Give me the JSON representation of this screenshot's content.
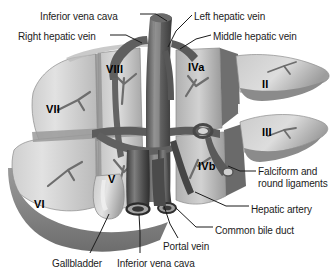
{
  "figure": {
    "width": 335,
    "height": 273,
    "background_color": "#ffffff",
    "style": "grayscale medical illustration"
  },
  "colors": {
    "background": "#ffffff",
    "text": "#1b1b1b",
    "leader_line": "#1b1b1b",
    "parenchyma_light": "#d9d9d9",
    "parenchyma_mid": "#b4b4b4",
    "parenchyma_dark": "#8f8f8f",
    "shadow": "#6e6e6e",
    "vessel_dark": "#4a4a4a",
    "vessel_darkest": "#2a2a2a",
    "vessel_mid": "#707070",
    "highlight": "#efefef"
  },
  "labels": [
    {
      "id": "inferior-vena-cava-top",
      "text": "Inferior vena cava",
      "x": 40,
      "y": 11,
      "align": "left"
    },
    {
      "id": "left-hepatic-vein",
      "text": "Left hepatic vein",
      "x": 194,
      "y": 11,
      "align": "left"
    },
    {
      "id": "right-hepatic-vein",
      "text": "Right hepatic vein",
      "x": 18,
      "y": 31,
      "align": "left"
    },
    {
      "id": "middle-hepatic-vein",
      "text": "Middle hepatic vein",
      "x": 213,
      "y": 31,
      "align": "left"
    },
    {
      "id": "falciform-round-ligaments",
      "text": "Falciform and\nround ligaments",
      "x": 258,
      "y": 166,
      "align": "left"
    },
    {
      "id": "hepatic-artery",
      "text": "Hepatic artery",
      "x": 251,
      "y": 204,
      "align": "left"
    },
    {
      "id": "common-bile-duct",
      "text": "Common bile duct",
      "x": 215,
      "y": 225,
      "align": "left"
    },
    {
      "id": "portal-vein",
      "text": "Portal vein",
      "x": 163,
      "y": 241,
      "align": "left"
    },
    {
      "id": "gallbladder",
      "text": "Gallbladder",
      "x": 52,
      "y": 258,
      "align": "left"
    },
    {
      "id": "inferior-vena-cava-bottom",
      "text": "Inferior vena cava",
      "x": 117,
      "y": 258,
      "align": "left"
    }
  ],
  "segments": [
    {
      "id": "segment-VIII",
      "text": "VIII",
      "x": 106,
      "y": 63
    },
    {
      "id": "segment-IVa",
      "text": "IVa",
      "x": 188,
      "y": 61
    },
    {
      "id": "segment-II",
      "text": "II",
      "x": 262,
      "y": 78
    },
    {
      "id": "segment-VII",
      "text": "VII",
      "x": 46,
      "y": 103
    },
    {
      "id": "segment-III",
      "text": "III",
      "x": 262,
      "y": 126
    },
    {
      "id": "segment-IVb",
      "text": "IVb",
      "x": 198,
      "y": 160
    },
    {
      "id": "segment-V",
      "text": "V",
      "x": 108,
      "y": 173
    },
    {
      "id": "segment-VI",
      "text": "VI",
      "x": 34,
      "y": 198
    }
  ],
  "leader_lines": [
    {
      "id": "leader-inferior-vena-cava-top",
      "points": "140,14 156,14 167,21"
    },
    {
      "id": "leader-right-hepatic-vein",
      "points": "110,35 126,35 142,43"
    },
    {
      "id": "leader-left-hepatic-vein",
      "points": "192,15 176,31 168,47"
    },
    {
      "id": "leader-middle-hepatic-vein",
      "points": "211,35 196,39 180,49"
    },
    {
      "id": "leader-falciform-round-ligaments",
      "points": "256,171 240,171 228,166"
    },
    {
      "id": "leader-hepatic-artery",
      "points": "249,206 226,206 195,192"
    },
    {
      "id": "leader-common-bile-duct",
      "points": "213,227 196,227 176,208"
    },
    {
      "id": "leader-portal-vein",
      "points": "178,238 170,224 164,206"
    },
    {
      "id": "leader-gallbladder",
      "points": "90,253 100,233 109,214"
    },
    {
      "id": "leader-inferior-vena-cava-bottom",
      "points": "140,253 140,232 139,214"
    }
  ],
  "anatomy_parts": [
    "inferior-vena-cava-trunk",
    "right-hepatic-vein-branch",
    "left-hepatic-vein-branch",
    "middle-hepatic-vein-branch",
    "portal-vein-trunk",
    "portal-vein-bifurcation-ring",
    "hepatic-artery-branch",
    "common-bile-duct-tube",
    "gallbladder-body",
    "falciform-ligament",
    "liver-parenchyma-blocks"
  ]
}
